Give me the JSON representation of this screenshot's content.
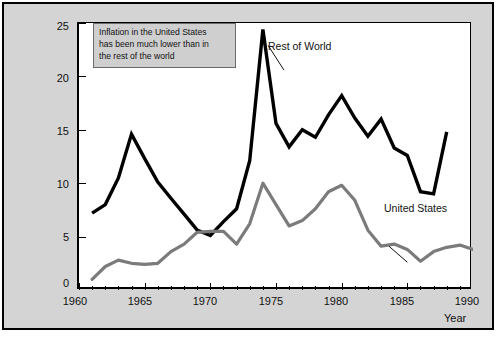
{
  "chart_data": {
    "type": "line",
    "title": "",
    "xlabel": "Year",
    "ylabel": "Inflation rate (percent per year)",
    "xlim": [
      1960,
      1990
    ],
    "ylim": [
      0,
      25
    ],
    "xticks": [
      1960,
      1965,
      1970,
      1975,
      1980,
      1985,
      1990
    ],
    "yticks": [
      0,
      5,
      10,
      15,
      20,
      25
    ],
    "minor_xtick_interval": 1,
    "grid": false,
    "legend": "inline-labels",
    "annotations": [
      {
        "name": "callout-box",
        "text": "Inflation in the United States has been much lower than in the rest of the world"
      }
    ],
    "series": [
      {
        "name": "Rest of World",
        "color": "#000000",
        "width": 3.4,
        "x": [
          1961,
          1962,
          1963,
          1964,
          1965,
          1966,
          1967,
          1968,
          1969,
          1970,
          1971,
          1972,
          1973,
          1974,
          1975,
          1976,
          1977,
          1978,
          1979,
          1980,
          1981,
          1982,
          1983,
          1984,
          1985,
          1986,
          1987,
          1988
        ],
        "values": [
          7.2,
          8.0,
          10.5,
          14.6,
          12.3,
          10.1,
          8.6,
          7.1,
          5.6,
          5.1,
          6.4,
          7.6,
          12.1,
          24.4,
          15.6,
          13.4,
          15.0,
          14.3,
          16.4,
          18.2,
          16.1,
          14.4,
          16.0,
          13.3,
          12.6,
          9.2,
          9.0,
          14.8
        ]
      },
      {
        "name": "United States",
        "color": "#7b7b7b",
        "width": 3.2,
        "x": [
          1961,
          1962,
          1963,
          1964,
          1965,
          1966,
          1967,
          1968,
          1969,
          1970,
          1971,
          1972,
          1973,
          1974,
          1975,
          1976,
          1977,
          1978,
          1979,
          1980,
          1981,
          1982,
          1983,
          1984,
          1985,
          1986,
          1987,
          1988,
          1989,
          1990
        ],
        "values": [
          1.0,
          2.2,
          2.8,
          2.5,
          2.4,
          2.5,
          3.6,
          4.3,
          5.4,
          5.5,
          5.5,
          4.3,
          6.2,
          10.0,
          8.0,
          6.0,
          6.5,
          7.6,
          9.2,
          9.8,
          8.4,
          5.6,
          4.1,
          4.3,
          3.8,
          2.7,
          3.6,
          4.0,
          4.2,
          3.8
        ]
      }
    ]
  },
  "labels": {
    "y_axis_title": "Inflation rate (percent per year)",
    "x_axis_title": "Year",
    "series_rest_of_world": "Rest of World",
    "series_united_states": "United States",
    "note_line1": "Inflation in the United States",
    "note_line2": "has been much lower than in",
    "note_line3": "the rest of the world",
    "y_0": "0",
    "y_5": "5",
    "y_10": "10",
    "y_15": "15",
    "y_20": "20",
    "y_25": "25",
    "x_1960": "1960",
    "x_1965": "1965",
    "x_1970": "1970",
    "x_1975": "1975",
    "x_1980": "1980",
    "x_1985": "1985",
    "x_1990": "1990"
  },
  "colors": {
    "panel_background": "#d4d4d4",
    "plot_background": "#ffffff",
    "frame": "#000000",
    "rest_of_world": "#000000",
    "united_states": "#7b7b7b",
    "note_background": "#cfcfcf",
    "note_border": "#6a6a6a"
  }
}
